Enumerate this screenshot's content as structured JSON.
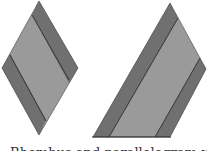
{
  "figure": {
    "caption": "Rhombus and parallelogram with strips",
    "colors": {
      "strip": "#707070",
      "body": "#9a9a9a",
      "outline": "#222222",
      "background": "#ffffff"
    },
    "shapes": [
      {
        "name": "rhombus",
        "description": "Rhombus with dark strips along upper-right and lower-left edges"
      },
      {
        "name": "parallelogram",
        "description": "Quadrilateral with two dark diagonal strips"
      }
    ]
  }
}
